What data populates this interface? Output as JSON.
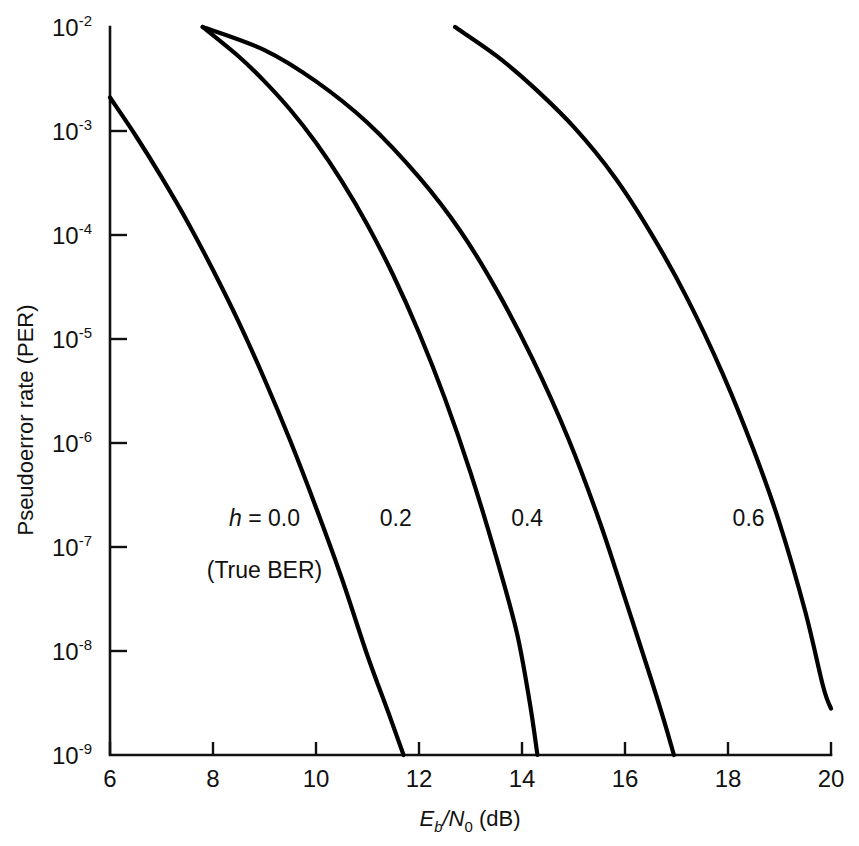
{
  "chart_data": {
    "type": "line",
    "title": "",
    "xlabel": "Eb/N0 (dB)",
    "ylabel": "Pseudoerror rate (PER)",
    "xlim": [
      6,
      20
    ],
    "ylim": [
      1e-09,
      0.01
    ],
    "yscale": "log",
    "grid": false,
    "legend": "inline-annotations",
    "xticks": [
      6,
      8,
      10,
      12,
      14,
      16,
      18,
      20
    ],
    "xtick_labels": [
      "6",
      "8",
      "10",
      "12",
      "14",
      "16",
      "18",
      "20"
    ],
    "yticks": [
      0.01,
      0.001,
      0.0001,
      1e-05,
      1e-06,
      1e-07,
      1e-08,
      1e-09
    ],
    "ytick_labels": [
      "10-2",
      "10-3",
      "10-4",
      "10-5",
      "10-6",
      "10-7",
      "10-8",
      "10-9"
    ],
    "ytick_mantissa": "10",
    "ytick_exponents": [
      "-2",
      "-3",
      "-4",
      "-5",
      "-6",
      "-7",
      "-8",
      "-9"
    ],
    "series": [
      {
        "name": "h = 0.0",
        "annotation": "h = 0.0",
        "annotation_sub": "(True BER)",
        "points": [
          [
            6.0,
            0.0021
          ],
          [
            6.5,
            0.0009
          ],
          [
            7.0,
            0.00036
          ],
          [
            7.5,
            0.000135
          ],
          [
            8.0,
            4.6e-05
          ],
          [
            8.5,
            1.45e-05
          ],
          [
            9.0,
            4.1e-06
          ],
          [
            9.5,
            1.05e-06
          ],
          [
            10.0,
            2.4e-07
          ],
          [
            10.5,
            5e-08
          ],
          [
            11.0,
            9e-09
          ],
          [
            11.4,
            2.6e-09
          ],
          [
            11.7,
            1e-09
          ]
        ]
      },
      {
        "name": "h = 0.2",
        "annotation": "0.2",
        "points": [
          [
            7.8,
            0.01
          ],
          [
            8.5,
            0.0052
          ],
          [
            9.0,
            0.003
          ],
          [
            9.5,
            0.0016
          ],
          [
            10.0,
            0.00077
          ],
          [
            10.5,
            0.00033
          ],
          [
            11.0,
            0.000125
          ],
          [
            11.5,
            4.1e-05
          ],
          [
            12.0,
            1.15e-05
          ],
          [
            12.5,
            2.7e-06
          ],
          [
            13.0,
            5.2e-07
          ],
          [
            13.5,
            8e-08
          ],
          [
            13.9,
            1.5e-08
          ],
          [
            14.15,
            3.2e-09
          ],
          [
            14.3,
            1e-09
          ]
        ]
      },
      {
        "name": "h = 0.4",
        "annotation": "0.4",
        "points": [
          [
            7.8,
            0.01
          ],
          [
            9.0,
            0.006
          ],
          [
            10.0,
            0.003
          ],
          [
            11.0,
            0.0012
          ],
          [
            12.0,
            0.00036
          ],
          [
            12.8,
            0.00011
          ],
          [
            13.5,
            3e-05
          ],
          [
            14.2,
            6.5e-06
          ],
          [
            14.9,
            1.1e-06
          ],
          [
            15.5,
            1.8e-07
          ],
          [
            16.0,
            3.2e-08
          ],
          [
            16.5,
            5.5e-09
          ],
          [
            16.75,
            2.2e-09
          ],
          [
            16.95,
            1e-09
          ]
        ]
      },
      {
        "name": "h = 0.6",
        "annotation": "0.6",
        "points": [
          [
            12.7,
            0.01
          ],
          [
            13.5,
            0.0053
          ],
          [
            14.2,
            0.0027
          ],
          [
            15.0,
            0.0011
          ],
          [
            15.8,
            0.00036
          ],
          [
            16.5,
            0.000105
          ],
          [
            17.2,
            2.5e-05
          ],
          [
            17.9,
            4.6e-06
          ],
          [
            18.5,
            8.5e-07
          ],
          [
            19.0,
            1.7e-07
          ],
          [
            19.5,
            2.4e-08
          ],
          [
            19.85,
            4.5e-09
          ],
          [
            20.0,
            2.8e-09
          ]
        ]
      }
    ],
    "annotations": [
      {
        "text": "h = 0.0",
        "x": 9.0,
        "y": 1.6e-07
      },
      {
        "text": "(True BER)",
        "x": 9.0,
        "y": 5e-08
      },
      {
        "text": "0.2",
        "x": 11.55,
        "y": 1.6e-07
      },
      {
        "text": "0.4",
        "x": 14.1,
        "y": 1.6e-07
      },
      {
        "text": "0.6",
        "x": 18.4,
        "y": 1.6e-07
      }
    ]
  },
  "axis": {
    "x_title_main": "E",
    "x_title_sub1": "b",
    "x_title_mid": "/N",
    "x_title_sub2": "0",
    "x_title_units": " (dB)",
    "y_title": "Pseudoerror rate (PER)"
  }
}
